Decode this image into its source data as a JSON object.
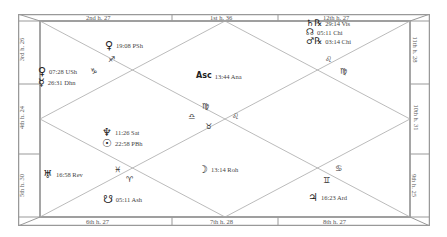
{
  "chart": {
    "type": "North Indian Rasi chart",
    "border_color": "#999999",
    "line_color": "#aaaaaa"
  },
  "house_labels": {
    "top": [
      "2nd h. 27",
      "1st h. 36",
      "12th h. 27"
    ],
    "bottom": [
      "6th h. 27",
      "7th h. 28",
      "8th h. 27"
    ],
    "left": [
      "3rd h. 26",
      "4th h. 24",
      "5th h. 30"
    ],
    "right": [
      "11th h. 28",
      "10th h. 31",
      "9th h. 25"
    ]
  },
  "signs": {
    "h1": "♍",
    "h2": "♐",
    "h3": "♑",
    "h4": "♒",
    "h5": "♓",
    "h6": "♈",
    "h7": "♉",
    "h8": "♊",
    "h9": "♋",
    "h10": "♌",
    "h11": "♌",
    "h12": "♍",
    "center_top": "♍",
    "center_left": "♎",
    "center_right": "♌",
    "center_bottom": "♉",
    "top_left": "♐",
    "left_top": "♑",
    "top_right": "♌",
    "right_top": "♍",
    "left_bottom": "♓",
    "bottom_left": "♈",
    "bottom_right": "♊",
    "right_bottom": "♋"
  },
  "planets": {
    "asc": {
      "glyph": "Asc",
      "text": "13:44 Ana"
    },
    "venus_h2": {
      "glyph": "♀",
      "text": "19:08 PSh"
    },
    "venus_h3": {
      "glyph": "♀",
      "text": "07:28 USh"
    },
    "mercury_h3": {
      "glyph": "☿",
      "text": "26:31 Dhn"
    },
    "neptune_h4": {
      "glyph": "♆",
      "text": "11:26 Sat"
    },
    "sun_h4": {
      "glyph": "☉",
      "text": "22:58 PBh"
    },
    "uranus_h5": {
      "glyph": "♅",
      "text": "16:58 Rev"
    },
    "ketu_h6": {
      "glyph": "☋",
      "text": "05:11 Ash"
    },
    "moon_h7": {
      "glyph": "☽",
      "text": "13:14 Roh"
    },
    "jupiter_h8": {
      "glyph": "♃",
      "text": "16:23 Ard"
    },
    "saturn_h12": {
      "glyph": "♄℞",
      "text": "29:14 Vis"
    },
    "rahu_h12": {
      "glyph": "☊",
      "text": "05:11 Chi"
    },
    "mars_h12": {
      "glyph": "♂℞",
      "text": "03:14 Chi"
    }
  }
}
